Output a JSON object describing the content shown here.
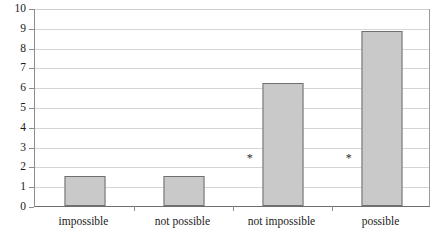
{
  "chart_data": {
    "type": "bar",
    "title": "",
    "subtitle": "",
    "xlabel": "",
    "ylabel": "",
    "categories": [
      "impossible",
      "not possible",
      "not impossible",
      "possible"
    ],
    "values": [
      1.5,
      1.5,
      6.2,
      8.85
    ],
    "series": [
      {
        "name": "",
        "values": [
          1.5,
          1.5,
          6.2,
          8.85
        ]
      }
    ],
    "ylim": [
      0,
      10
    ],
    "yticks": [
      0,
      1,
      2,
      3,
      4,
      5,
      6,
      7,
      8,
      9,
      10
    ],
    "ytick_labels": [
      "0",
      "1",
      "2",
      "3",
      "4",
      "5",
      "6",
      "7",
      "8",
      "9",
      "10"
    ],
    "grid": true,
    "grid_axis": "y",
    "legend": false,
    "legend_position": "none",
    "annotations": [
      {
        "text": "*",
        "category_index": 2,
        "x_offset": -0.33,
        "y": 2.5
      },
      {
        "text": "*",
        "category_index": 3,
        "x_offset": -0.33,
        "y": 2.5
      }
    ],
    "colors": {
      "bar_fill": "#c9c9c9",
      "bar_edge": "#6f6f6f",
      "gridline": "#d5d5d5",
      "axis": "#6e6e6e",
      "text": "#1b1b1b",
      "background": "#ffffff"
    }
  }
}
